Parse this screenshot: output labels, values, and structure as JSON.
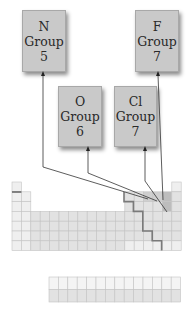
{
  "boxes": [
    {
      "symbol": "N",
      "group_label": "Group",
      "group_number": "5",
      "x": 22,
      "y": 10,
      "w": 42,
      "h": 60
    },
    {
      "symbol": "F",
      "group_label": "Group",
      "group_number": "7",
      "x": 135,
      "y": 10,
      "w": 42,
      "h": 60
    },
    {
      "symbol": "O",
      "group_label": "Group",
      "group_number": "6",
      "x": 58,
      "y": 86,
      "w": 42,
      "h": 59
    },
    {
      "symbol": "Cl",
      "group_label": "Group",
      "group_number": "7",
      "x": 114,
      "y": 86,
      "w": 41,
      "h": 59
    }
  ],
  "periodic_table": {
    "origin_x": 12,
    "origin_y": 182,
    "cell_w": 9.4,
    "cell_h": 9.8,
    "columns": 18,
    "rows": 7,
    "highlighted_cells": {
      "N": {
        "col": 15,
        "row": 2
      },
      "O": {
        "col": 16,
        "row": 2
      },
      "F": {
        "col": 17,
        "row": 2
      },
      "Cl": {
        "col": 17,
        "row": 3
      }
    },
    "f_block": {
      "x": 49,
      "y": 277,
      "cols": 14,
      "rows": 2
    }
  },
  "colors": {
    "box_fill": "#c9c9c9",
    "cell_light": "#efefef",
    "cell_mid": "#e2e2e2",
    "cell_highlight": "#cfcfcf",
    "cell_dark": "#bdbdbd",
    "grid_line": "#c4c4c4",
    "staircase": "#7a7a7a",
    "arrow": "#333333"
  }
}
